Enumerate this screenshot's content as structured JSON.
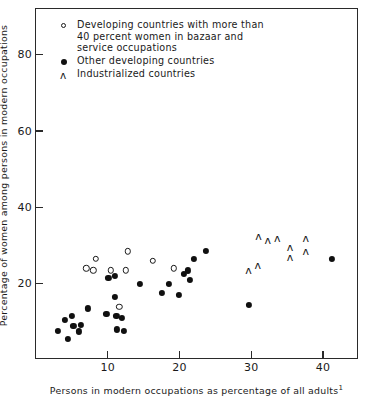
{
  "chart_data": {
    "type": "scatter",
    "title": "",
    "xlabel": "Persons in modern occupations as percentage of all adults",
    "xlabel_footnote": "1",
    "ylabel": "Percentage of women among persons in modern occupations",
    "xlim": [
      0,
      45
    ],
    "ylim": [
      0,
      92
    ],
    "xticks": [
      10,
      20,
      30,
      40
    ],
    "yticks": [
      20,
      40,
      60,
      80
    ],
    "xtick_labels": [
      "10",
      "20",
      "30",
      "40"
    ],
    "ytick_labels": [
      "20",
      "40",
      "60",
      "80"
    ],
    "grid": false,
    "legend_position": "top-left",
    "series": [
      {
        "name": "Developing countries with more than 40 percent women in bazaar and service occupations",
        "marker": "open-circle",
        "marker_color": "#191919",
        "points": [
          [
            8.3,
            26.5
          ],
          [
            7.0,
            24.0
          ],
          [
            8.0,
            23.5
          ],
          [
            10.4,
            23.5
          ],
          [
            12.5,
            23.5
          ],
          [
            12.8,
            28.5
          ],
          [
            16.3,
            26.0
          ],
          [
            19.2,
            24.0
          ],
          [
            11.6,
            14.0
          ]
        ]
      },
      {
        "name": "Other developing countries",
        "marker": "filled-circle",
        "marker_color": "#101010",
        "points": [
          [
            10.1,
            21.5
          ],
          [
            11.0,
            22.0
          ],
          [
            14.5,
            20.0
          ],
          [
            18.5,
            20.0
          ],
          [
            20.6,
            22.5
          ],
          [
            21.4,
            21.0
          ],
          [
            21.2,
            23.5
          ],
          [
            23.7,
            28.5
          ],
          [
            22.0,
            26.5
          ],
          [
            17.5,
            17.5
          ],
          [
            19.9,
            17.0
          ],
          [
            11.0,
            16.5
          ],
          [
            7.2,
            13.5
          ],
          [
            9.8,
            12.0
          ],
          [
            11.2,
            11.5
          ],
          [
            12.0,
            11.0
          ],
          [
            4.0,
            10.5
          ],
          [
            5.0,
            11.5
          ],
          [
            5.2,
            9.0
          ],
          [
            6.2,
            9.2
          ],
          [
            6.0,
            7.5
          ],
          [
            4.5,
            5.5
          ],
          [
            3.1,
            7.7
          ],
          [
            11.3,
            8.0
          ],
          [
            12.2,
            7.7
          ],
          [
            29.7,
            14.5
          ],
          [
            41.2,
            26.5
          ]
        ]
      },
      {
        "name": "Industrialized countries",
        "marker": "triangle",
        "marker_color": "#1a1a1a",
        "points": [
          [
            31.0,
            32.5
          ],
          [
            32.3,
            31.5
          ],
          [
            33.6,
            32.0
          ],
          [
            35.4,
            29.5
          ],
          [
            35.4,
            27.0
          ],
          [
            37.6,
            32.0
          ],
          [
            37.6,
            28.5
          ],
          [
            29.6,
            23.5
          ],
          [
            30.9,
            25.0
          ]
        ]
      }
    ],
    "legend_entries": [
      {
        "marker": "open-circle",
        "lines": [
          "Developing countries with more than",
          "40 percent women in bazaar and",
          "service occupations"
        ]
      },
      {
        "marker": "filled-circle",
        "lines": [
          "Other developing countries"
        ]
      },
      {
        "marker": "triangle",
        "lines": [
          "Industrialized countries"
        ]
      }
    ]
  }
}
